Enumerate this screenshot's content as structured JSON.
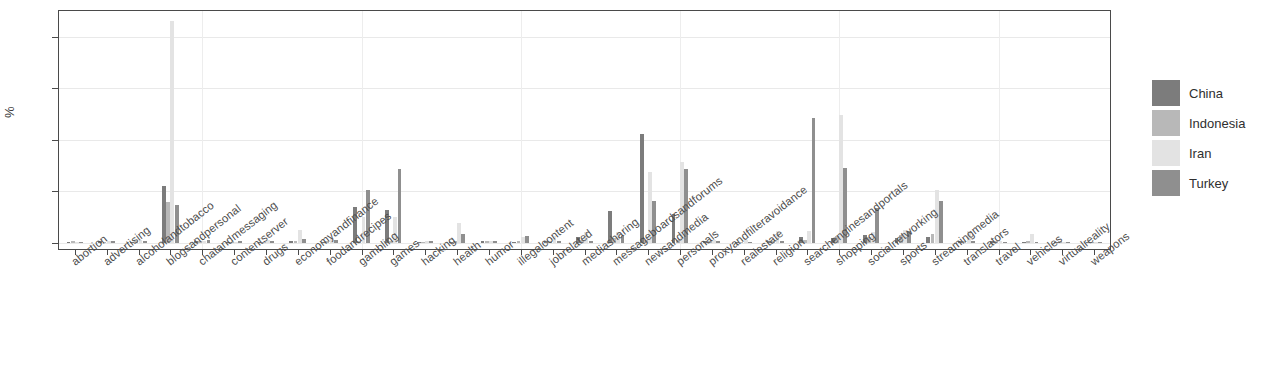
{
  "chart_data": {
    "type": "bar",
    "title": "",
    "xlabel": "",
    "ylabel": "%",
    "ylim": [
      0,
      45
    ],
    "yticks": [
      0,
      10,
      20,
      30,
      40
    ],
    "grid": true,
    "legend_position": "right",
    "orientation": "grouped-vertical",
    "categories": [
      "abortion",
      "advertising",
      "alcoholandtobacco",
      "blogsandpersonal",
      "chatandmessaging",
      "contentserver",
      "drugs",
      "economyandfinance",
      "foodandrecipes",
      "gambling",
      "games",
      "hacking",
      "health",
      "humor",
      "illegalcontent",
      "jobrelated",
      "mediasharing",
      "messageboardsandforums",
      "newsandmedia",
      "personals",
      "proxyandfilteravoidance",
      "realestate",
      "religion",
      "searchenginesandportals",
      "shopping",
      "socialnetworking",
      "sports",
      "streamingmedia",
      "translators",
      "travel",
      "vehicles",
      "virtualreality",
      "weapons"
    ],
    "series": [
      {
        "name": "China",
        "color": "#7c7c7c",
        "values": [
          0.2,
          0.3,
          0.2,
          11.0,
          0.3,
          0.2,
          0.2,
          0.3,
          0.2,
          7.0,
          6.5,
          0.2,
          0.2,
          0.3,
          0.2,
          0.3,
          1.2,
          6.3,
          21.2,
          5.6,
          0.3,
          0.2,
          0.3,
          1.2,
          1.0,
          1.5,
          1.0,
          1.2,
          0.3,
          0.3,
          0.2,
          0.2,
          0.2
        ]
      },
      {
        "name": "Indonesia",
        "color": "#b8b8b8",
        "values": [
          0.3,
          0.2,
          0.3,
          8.0,
          0.3,
          0.2,
          0.2,
          0.4,
          0.4,
          0.3,
          0.3,
          0.2,
          0.3,
          0.3,
          0.3,
          0.3,
          0.6,
          1.0,
          0.5,
          0.6,
          0.4,
          0.2,
          0.4,
          0.6,
          1.4,
          1.2,
          1.5,
          1.8,
          0.4,
          0.4,
          0.4,
          0.3,
          0.2
        ]
      },
      {
        "name": "Iran",
        "color": "#e3e3e3",
        "values": [
          0.2,
          0.4,
          0.6,
          43.0,
          0.4,
          0.2,
          0.5,
          2.6,
          0.9,
          5.0,
          5.0,
          0.3,
          3.9,
          0.3,
          1.2,
          1.4,
          2.2,
          2.1,
          13.8,
          15.8,
          0.5,
          0.6,
          2.3,
          2.4,
          24.8,
          2.2,
          2.6,
          10.2,
          2.3,
          0.4,
          1.8,
          0.2,
          0.2
        ]
      },
      {
        "name": "Turkey",
        "color": "#8f8f8f",
        "values": [
          0.2,
          0.3,
          0.3,
          7.3,
          0.6,
          0.3,
          0.3,
          0.7,
          0.6,
          10.2,
          14.4,
          0.3,
          1.7,
          0.3,
          1.4,
          0.3,
          0.4,
          1.4,
          8.1,
          14.4,
          0.3,
          0.2,
          0.3,
          24.3,
          14.5,
          6.7,
          2.4,
          8.1,
          0.3,
          0.2,
          0.2,
          0.2,
          0.2
        ]
      }
    ]
  },
  "legend": {
    "items": [
      {
        "label": "China"
      },
      {
        "label": "Indonesia"
      },
      {
        "label": "Iran"
      },
      {
        "label": "Turkey"
      }
    ]
  }
}
